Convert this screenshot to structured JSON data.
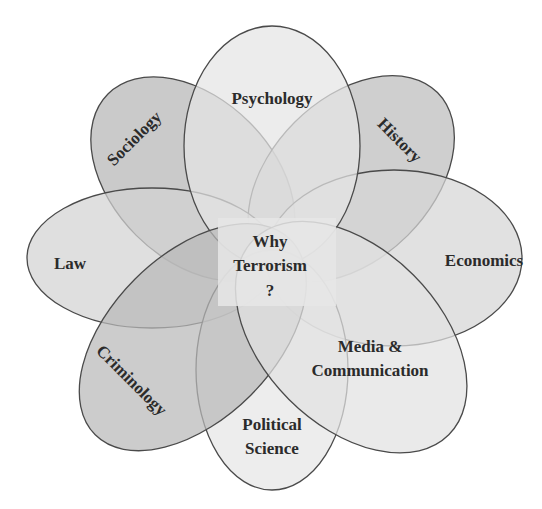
{
  "diagram": {
    "title": "Why Terrorism ?",
    "center": {
      "lines": [
        "Why",
        "Terrorism",
        "?"
      ]
    },
    "disciplines": [
      {
        "key": "psychology",
        "lines": [
          "Psychology"
        ],
        "angle_deg": 0,
        "fill": "#e4e4e4"
      },
      {
        "key": "history",
        "lines": [
          "History"
        ],
        "angle_deg": 45,
        "fill": "#bdbdbd"
      },
      {
        "key": "economics",
        "lines": [
          "Economics"
        ],
        "angle_deg": 90,
        "fill": "#d6d6d6"
      },
      {
        "key": "media",
        "lines": [
          "Media &",
          "Communication"
        ],
        "angle_deg": 135,
        "fill": "#e2e2e2"
      },
      {
        "key": "political-science",
        "lines": [
          "Political",
          "Science"
        ],
        "angle_deg": 180,
        "fill": "#e6e6e6"
      },
      {
        "key": "criminology",
        "lines": [
          "Criminology"
        ],
        "angle_deg": 225,
        "fill": "#b8b8b8"
      },
      {
        "key": "law",
        "lines": [
          "Law"
        ],
        "angle_deg": 270,
        "fill": "#d2d2d2"
      },
      {
        "key": "sociology",
        "lines": [
          "Sociology"
        ],
        "angle_deg": 315,
        "fill": "#b5b5b5"
      }
    ]
  }
}
